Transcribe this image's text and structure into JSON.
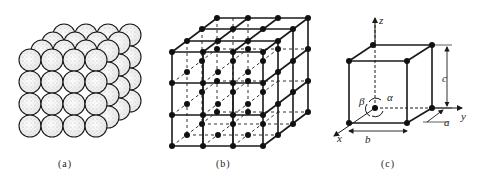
{
  "figure": {
    "panels": [
      {
        "id": "a",
        "caption": "(a)",
        "description": "close-packed spheres in cubic arrangement"
      },
      {
        "id": "b",
        "caption": "(b)",
        "description": "space lattice with lattice points"
      },
      {
        "id": "c",
        "caption": "(c)",
        "description": "unit cell with lattice parameters"
      }
    ],
    "unit_cell_labels": {
      "z_axis": "z",
      "y_axis": "y",
      "x_axis": "x",
      "edge_a": "a",
      "edge_b": "b",
      "edge_c": "c",
      "angle_alpha": "α",
      "angle_beta": "β",
      "angle_gamma": "γ"
    },
    "colors": {
      "line": "#1a1a1a",
      "sphere_fill": "#f2f2f2",
      "stipple": "#8a8a8a"
    }
  }
}
